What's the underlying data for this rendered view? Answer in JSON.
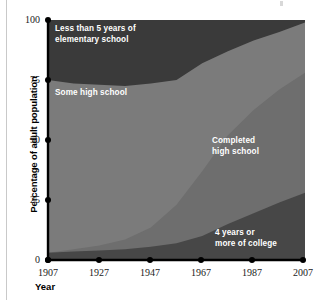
{
  "axes": {
    "y_title": "Percentage of adult population",
    "x_title": "Year",
    "y_ticks": [
      "100",
      "75",
      "50",
      "25",
      "0"
    ],
    "x_ticks": [
      "1907",
      "1927",
      "1947",
      "1967",
      "1987",
      "2007"
    ]
  },
  "labels": {
    "elementary": "Less than 5 years of\nelementary school",
    "some_high_school": "Some high school",
    "completed_high_school": "Completed\nhigh school",
    "college": "4 years or\nmore of college"
  },
  "colors": {
    "elementary": "#3a3a3a",
    "some_high_school": "#7b7b7b",
    "completed_high_school": "#6e6e6e",
    "college": "#474747",
    "axis": "#000000",
    "label_text": "#ffffff",
    "background": "#ffffff"
  },
  "chart_data": {
    "type": "area",
    "title": "",
    "subtitle": "",
    "xlabel": "Year",
    "ylabel": "Percentage of adult population",
    "xlim": [
      1907,
      2007
    ],
    "ylim": [
      0,
      100
    ],
    "grid": false,
    "legend_position": "inline-labels",
    "stacked": true,
    "stack_order": "bottom-to-top",
    "x": [
      1907,
      1917,
      1927,
      1937,
      1947,
      1957,
      1967,
      1977,
      1987,
      1997,
      2007
    ],
    "series": [
      {
        "name": "4 years or more of college",
        "label": "4 years or\nmore of college",
        "color": "#474747",
        "values": [
          3,
          3.5,
          4,
          4.5,
          5.5,
          7,
          10,
          15,
          19.5,
          24,
          28
        ]
      },
      {
        "name": "Completed high school",
        "label": "Completed\nhigh school",
        "color": "#6e6e6e",
        "values": [
          0,
          1,
          2,
          4,
          8,
          16,
          27,
          37,
          43,
          47,
          50
        ]
      },
      {
        "name": "Some high school",
        "label": "Some high school",
        "color": "#7b7b7b",
        "values": [
          72,
          69,
          67,
          64,
          60,
          52,
          45,
          35,
          29,
          24,
          21
        ]
      },
      {
        "name": "Less than 5 years of elementary school",
        "label": "Less than 5 years of\nelementary school",
        "color": "#3a3a3a",
        "values": [
          25,
          26.5,
          27,
          27.5,
          26.5,
          25,
          18,
          13,
          8.5,
          5,
          1
        ]
      }
    ],
    "cumulative_top_boundaries": {
      "college": [
        3,
        3.5,
        4,
        4.5,
        5.5,
        7,
        10,
        15,
        19.5,
        24,
        28
      ],
      "completed_high_school": [
        3,
        4.5,
        6,
        8.5,
        13.5,
        23,
        37,
        52,
        62.5,
        71,
        78
      ],
      "some_high_school": [
        75,
        73.5,
        73,
        72.5,
        73.5,
        75,
        82,
        87,
        91.5,
        95,
        99
      ],
      "elementary": [
        100,
        100,
        100,
        100,
        100,
        100,
        100,
        100,
        100,
        100,
        100
      ]
    }
  }
}
